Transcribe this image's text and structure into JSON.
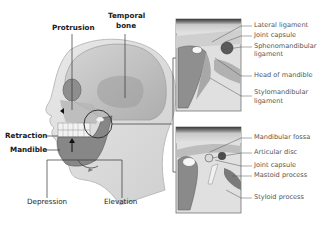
{
  "diagram": {
    "head_labels": {
      "protrusion": "Protrusion",
      "temporal_bone": "Temporal\nbone",
      "temporal_bone_line1": "Temporal",
      "temporal_bone_line2": "bone",
      "retraction": "Retraction",
      "mandible": "Mandible",
      "depression": "Depression",
      "elevation": "Elevation"
    },
    "inset_top": {
      "labels": [
        {
          "line1": "Lateral ligament",
          "line2": ""
        },
        {
          "line1": "Joint capsule",
          "line2": ""
        },
        {
          "line1": "Sphenomandibular",
          "line2": "ligament"
        },
        {
          "line1": "Head of mandible",
          "line2": ""
        },
        {
          "line1": "Stylomandibular",
          "line2": "ligament"
        }
      ]
    },
    "inset_bottom": {
      "labels": [
        {
          "line1": "Mandibular fossa"
        },
        {
          "line1": "Articular disc"
        },
        {
          "line1": "Joint capsule"
        },
        {
          "line1": "Mastoid process"
        },
        {
          "line1": "Styloid process"
        }
      ]
    },
    "colors": {
      "background": "#ffffff",
      "skin": "#dcdcdc",
      "skull": "#bdbdbd",
      "leader_line": "#333333",
      "label_text": "#222222",
      "inset_label_text": "#555555"
    }
  }
}
